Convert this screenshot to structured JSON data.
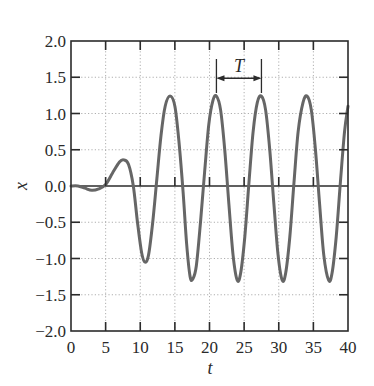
{
  "chart_data": {
    "type": "line",
    "title": "",
    "xlabel": "t",
    "ylabel": "x",
    "xlim": [
      0,
      40
    ],
    "ylim": [
      -2.0,
      2.0
    ],
    "grid": true,
    "legend": null,
    "x_ticks": [
      "0",
      "5",
      "10",
      "15",
      "20",
      "25",
      "30",
      "35",
      "40"
    ],
    "y_ticks": [
      "2.0",
      "1.5",
      "1.0",
      "0.5",
      "0.0",
      "-0.5",
      "-1.0",
      "-1.5",
      "-2.0"
    ],
    "annotations": [
      {
        "text": "T",
        "type": "period-arrow",
        "x_start": 21.0,
        "x_end": 27.5,
        "y": 1.5
      }
    ],
    "series": [
      {
        "name": "x(t)",
        "color": "#666666",
        "points": [
          [
            0,
            0.0
          ],
          [
            1,
            0.0
          ],
          [
            2,
            -0.03
          ],
          [
            3,
            -0.06
          ],
          [
            4,
            -0.04
          ],
          [
            5,
            0.02
          ],
          [
            6,
            0.18
          ],
          [
            7,
            0.33
          ],
          [
            7.6,
            0.36
          ],
          [
            8.3,
            0.3
          ],
          [
            9,
            0.0
          ],
          [
            9.6,
            -0.5
          ],
          [
            10.2,
            -0.92
          ],
          [
            10.7,
            -1.05
          ],
          [
            11.2,
            -0.95
          ],
          [
            11.8,
            -0.5
          ],
          [
            12.4,
            0.1
          ],
          [
            13.0,
            0.7
          ],
          [
            13.6,
            1.1
          ],
          [
            14.3,
            1.24
          ],
          [
            15.0,
            1.1
          ],
          [
            15.6,
            0.6
          ],
          [
            16.2,
            -0.1
          ],
          [
            16.7,
            -0.8
          ],
          [
            17.2,
            -1.25
          ],
          [
            17.6,
            -1.28
          ],
          [
            18.1,
            -1.1
          ],
          [
            18.7,
            -0.5
          ],
          [
            19.3,
            0.2
          ],
          [
            19.9,
            0.85
          ],
          [
            20.5,
            1.18
          ],
          [
            21.0,
            1.24
          ],
          [
            21.6,
            1.05
          ],
          [
            22.2,
            0.5
          ],
          [
            22.8,
            -0.25
          ],
          [
            23.4,
            -0.95
          ],
          [
            24.0,
            -1.3
          ],
          [
            24.5,
            -1.2
          ],
          [
            25.1,
            -0.7
          ],
          [
            25.7,
            0.05
          ],
          [
            26.3,
            0.75
          ],
          [
            26.9,
            1.15
          ],
          [
            27.5,
            1.24
          ],
          [
            28.1,
            1.05
          ],
          [
            28.7,
            0.5
          ],
          [
            29.3,
            -0.25
          ],
          [
            29.9,
            -0.95
          ],
          [
            30.5,
            -1.3
          ],
          [
            31.0,
            -1.2
          ],
          [
            31.6,
            -0.7
          ],
          [
            32.2,
            0.05
          ],
          [
            32.8,
            0.75
          ],
          [
            33.5,
            1.15
          ],
          [
            34.1,
            1.24
          ],
          [
            34.7,
            1.05
          ],
          [
            35.3,
            0.5
          ],
          [
            35.9,
            -0.25
          ],
          [
            36.5,
            -0.95
          ],
          [
            37.2,
            -1.3
          ],
          [
            37.7,
            -1.2
          ],
          [
            38.3,
            -0.7
          ],
          [
            38.9,
            0.05
          ],
          [
            39.5,
            0.75
          ],
          [
            40,
            1.1
          ]
        ]
      }
    ]
  }
}
